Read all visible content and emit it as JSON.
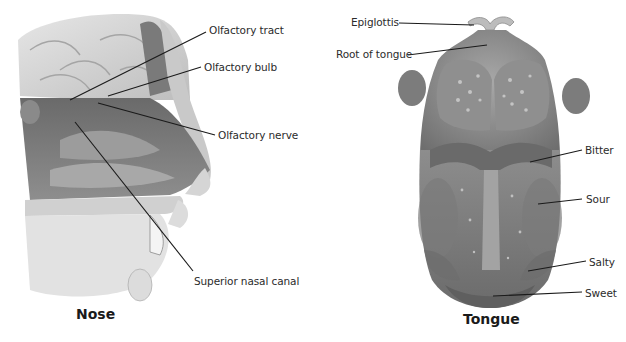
{
  "figures": [
    {
      "id": "nose",
      "caption": "Nose",
      "labels": [
        {
          "text": "Olfactory tract",
          "x": 209,
          "y": 27
        },
        {
          "text": "Olfactory bulb",
          "x": 204,
          "y": 62
        },
        {
          "text": "Olfactory nerve",
          "x": 218,
          "y": 130
        },
        {
          "text": "Superior nasal canal",
          "x": 194,
          "y": 277
        }
      ]
    },
    {
      "id": "tongue",
      "caption": "Tongue",
      "labels": [
        {
          "text": "Epiglottis",
          "x": 351,
          "y": 17
        },
        {
          "text": "Root of tongue",
          "x": 336,
          "y": 49
        },
        {
          "text": "Bitter",
          "x": 585,
          "y": 145
        },
        {
          "text": "Sour",
          "x": 586,
          "y": 194
        },
        {
          "text": "Salty",
          "x": 589,
          "y": 256
        },
        {
          "text": "Sweet",
          "x": 585,
          "y": 287
        }
      ]
    }
  ],
  "colors": {
    "background": "#ffffff",
    "label_text": "#2b2b2b",
    "leader_line": "#1a1a1a",
    "tissue_light": "#d9d9d9",
    "tissue_mid": "#9a9a9a",
    "tissue_dark": "#5e5e5e"
  }
}
